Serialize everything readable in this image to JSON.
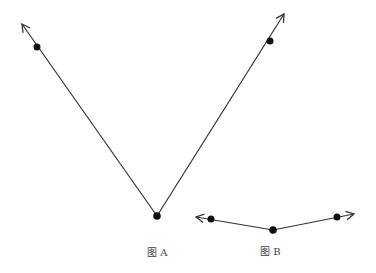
{
  "figures": [
    {
      "id": "A",
      "caption": "图 A",
      "caption_pos": [
        147,
        244
      ],
      "vertex": [
        157,
        216
      ],
      "rays": [
        {
          "point": [
            37,
            47
          ],
          "tip": [
            22,
            24
          ]
        },
        {
          "point": [
            270,
            41
          ],
          "tip": [
            284,
            14
          ]
        }
      ]
    },
    {
      "id": "B",
      "caption": "图 B",
      "caption_pos": [
        260,
        243
      ],
      "vertex": [
        273,
        230
      ],
      "rays": [
        {
          "point": [
            211,
            219
          ],
          "tip": [
            196,
            217
          ]
        },
        {
          "point": [
            337,
            217
          ],
          "tip": [
            354,
            214
          ]
        }
      ]
    }
  ],
  "colors": {
    "line": "#333333",
    "point": "#111111"
  }
}
